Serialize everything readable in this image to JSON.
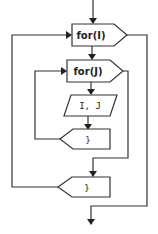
{
  "diagram": {
    "type": "flowchart",
    "nodes": [
      {
        "id": "outer_loop",
        "shape": "loop-start",
        "label": "for(I)"
      },
      {
        "id": "inner_loop",
        "shape": "loop-start",
        "label": "for(J)"
      },
      {
        "id": "output",
        "shape": "parallelogram",
        "label": "I, J"
      },
      {
        "id": "inner_end",
        "shape": "loop-end",
        "label": "}"
      },
      {
        "id": "outer_end",
        "shape": "loop-end",
        "label": "}"
      }
    ],
    "edges": [
      {
        "from": "start",
        "to": "outer_loop"
      },
      {
        "from": "outer_loop",
        "to": "inner_loop"
      },
      {
        "from": "inner_loop",
        "to": "output"
      },
      {
        "from": "output",
        "to": "inner_end"
      },
      {
        "from": "inner_end",
        "to": "inner_loop",
        "type": "loop-back"
      },
      {
        "from": "inner_loop",
        "to": "outer_end",
        "type": "loop-exit"
      },
      {
        "from": "outer_end",
        "to": "outer_loop",
        "type": "loop-back"
      },
      {
        "from": "outer_loop",
        "to": "end",
        "type": "loop-exit"
      }
    ]
  }
}
